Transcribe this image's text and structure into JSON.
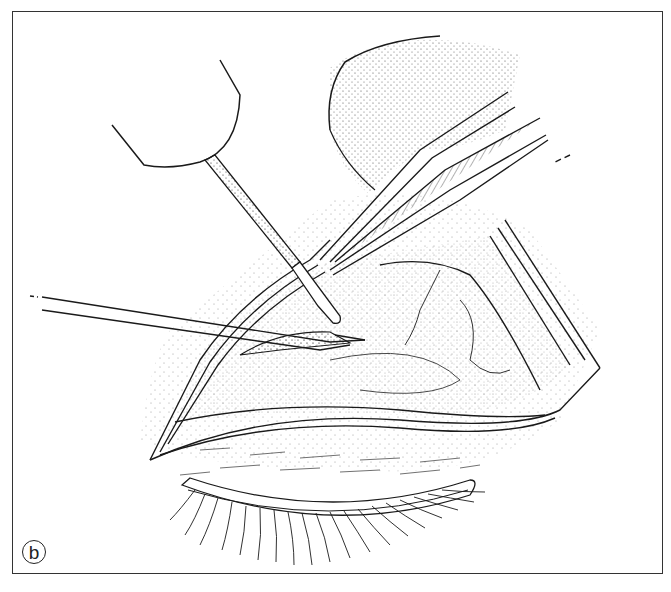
{
  "figure": {
    "panel_label": "b",
    "elements": [
      "finger-tip",
      "cotton-tipped-applicator",
      "forceps",
      "probe-instrument",
      "eyelid-incision",
      "eyelashes"
    ]
  },
  "colors": {
    "line": "#1a1a1a",
    "frame": "#333333",
    "background": "#ffffff"
  }
}
